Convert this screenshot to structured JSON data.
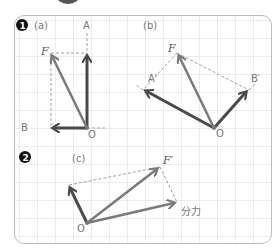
{
  "section1": {
    "badge": "1",
    "panel_a": {
      "label": "(a)",
      "points": {
        "A": "A",
        "B": "B",
        "F": "F",
        "O": "O"
      }
    },
    "panel_b": {
      "label": "(b)",
      "points": {
        "A": "A′",
        "B": "B′",
        "F": "F",
        "O": "O"
      }
    }
  },
  "section2": {
    "badge": "2",
    "panel_c": {
      "label": "(c)",
      "points": {
        "F": "F′",
        "O": "O"
      },
      "component_label": "分力"
    }
  },
  "colors": {
    "dark_arrow": "#4a4a4a",
    "light_arrow": "#7a7a7a",
    "dashed": "#a0a0a0",
    "grid": "#ececec",
    "border": "#bdbdbd"
  }
}
